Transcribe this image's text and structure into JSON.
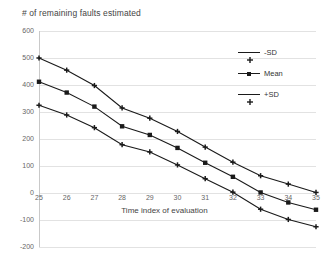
{
  "chart_data": {
    "type": "line",
    "title": "# of remaining faults estimated",
    "xlabel": "Time index of evaluation",
    "ylabel": "",
    "x": [
      25,
      26,
      27,
      28,
      29,
      30,
      31,
      32,
      33,
      34,
      35
    ],
    "xtick_labels": [
      "25",
      "26",
      "27",
      "28",
      "29",
      "30",
      "31",
      "32",
      "33",
      "34",
      "35"
    ],
    "ytick_labels": [
      "600",
      "500",
      "400",
      "300",
      "200",
      "100",
      "0",
      "-100",
      "-200"
    ],
    "ytick_values": [
      600,
      500,
      400,
      300,
      200,
      100,
      0,
      -100,
      -200
    ],
    "ylim": [
      -200,
      600
    ],
    "xlim": [
      25,
      35
    ],
    "grid": "horizontal",
    "legend_position": "right-top",
    "series": [
      {
        "name": "-SD",
        "marker": "plus",
        "color": "#1a1a1a",
        "values": [
          500,
          455,
          398,
          315,
          277,
          228,
          170,
          114,
          64,
          33,
          2
        ]
      },
      {
        "name": "Mean",
        "marker": "square",
        "color": "#1a1a1a",
        "values": [
          412,
          372,
          320,
          247,
          215,
          167,
          112,
          60,
          2,
          -35,
          -62
        ]
      },
      {
        "name": "+SD",
        "marker": "plus",
        "color": "#1a1a1a",
        "values": [
          325,
          289,
          242,
          179,
          152,
          104,
          53,
          3,
          -60,
          -98,
          -125
        ]
      }
    ]
  },
  "colors": {
    "gridline": "#e2e2e2",
    "axis": "#c9c9c9",
    "series": "#1a1a1a",
    "text": "#555555",
    "background": "#ffffff"
  }
}
